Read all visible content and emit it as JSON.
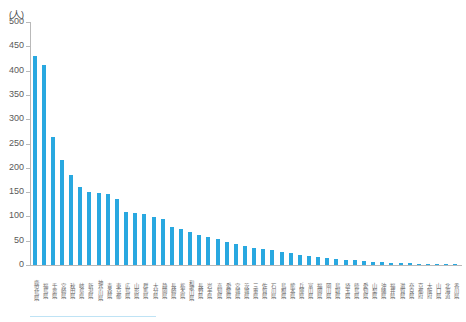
{
  "chart": {
    "type": "bar",
    "unit_label": "(人)",
    "bar_color": "#29a8e0",
    "axis_color": "#b9b9b9"
  },
  "chart_data": {
    "type": "bar",
    "title": "",
    "subtitle": "",
    "xlabel": "",
    "ylabel": "(人)",
    "ylim": [
      0,
      500
    ],
    "ytick_step": 50,
    "yticks": [
      0,
      50,
      100,
      150,
      200,
      250,
      300,
      350,
      400,
      450,
      500
    ],
    "grid": false,
    "legend": "none",
    "categories": [
      "鹿児島県",
      "福島県",
      "千葉県",
      "宮崎県",
      "秋田県",
      "岐阜県",
      "新潟県",
      "神奈川県",
      "青森県",
      "東京都",
      "広島県",
      "山形県",
      "群馬県",
      "大分県",
      "静岡県",
      "長崎県",
      "栃木県",
      "和歌山県",
      "長野県",
      "岩手県",
      "高知県",
      "愛媛県",
      "宮城県",
      "茨城県",
      "三重県",
      "佐賀県",
      "石川県",
      "島根県",
      "熊本県",
      "兵庫県",
      "富山県",
      "福岡県",
      "岡山県",
      "鳥取県",
      "埼玉県",
      "徳島県",
      "愛知県",
      "山梨県",
      "沖縄県",
      "福井県",
      "滋賀県",
      "奈良県",
      "京都府",
      "大阪府",
      "山口県",
      "北海道",
      "香川県"
    ],
    "values": [
      430,
      411,
      263,
      216,
      185,
      160,
      150,
      148,
      146,
      135,
      110,
      106,
      104,
      99,
      94,
      78,
      74,
      68,
      62,
      57,
      53,
      48,
      44,
      40,
      36,
      33,
      30,
      27,
      24,
      21,
      19,
      17,
      15,
      13,
      11,
      10,
      8,
      7,
      6,
      5,
      4,
      4,
      3,
      3,
      2,
      2,
      1
    ],
    "series": [
      {
        "name": "人数",
        "values": [
          430,
          411,
          263,
          216,
          185,
          160,
          150,
          148,
          146,
          135,
          110,
          106,
          104,
          99,
          94,
          78,
          74,
          68,
          62,
          57,
          53,
          48,
          44,
          40,
          36,
          33,
          30,
          27,
          24,
          21,
          19,
          17,
          15,
          13,
          11,
          10,
          8,
          7,
          6,
          5,
          4,
          4,
          3,
          3,
          2,
          2,
          1
        ]
      }
    ]
  }
}
